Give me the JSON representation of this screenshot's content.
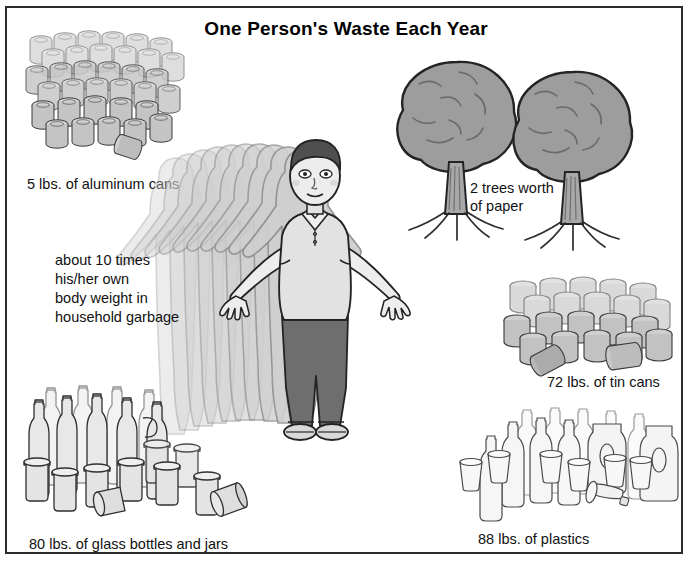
{
  "poster": {
    "title": "One Person's Waste Each Year",
    "background": "#ffffff",
    "border_color": "#2b2b2b",
    "text_color": "#111111"
  },
  "items": [
    {
      "id": "aluminum-cans",
      "label": "5 lbs. of aluminum cans",
      "amount": 5,
      "unit": "lbs.",
      "material": "aluminum cans"
    },
    {
      "id": "paper-trees",
      "label": "2 trees worth\nof paper",
      "amount": 2,
      "unit": "trees",
      "material": "paper"
    },
    {
      "id": "household-garbage",
      "label": "about 10 times\nhis/her own\nbody weight in\nhousehold garbage",
      "amount": 10,
      "unit": "times body weight",
      "material": "household garbage"
    },
    {
      "id": "tin-cans",
      "label": "72 lbs. of tin cans",
      "amount": 72,
      "unit": "lbs.",
      "material": "tin cans"
    },
    {
      "id": "glass",
      "label": "80 lbs. of glass bottles and jars",
      "amount": 80,
      "unit": "lbs.",
      "material": "glass bottles and jars"
    },
    {
      "id": "plastics",
      "label": "88 lbs. of plastics",
      "amount": 88,
      "unit": "lbs.",
      "material": "plastics"
    }
  ],
  "figure": {
    "ghost_copies": 10,
    "hair_color": "#4f4f4f",
    "shirt_color": "#e2e2e2",
    "pants_color": "#6e6e6e",
    "skin_color": "#ededed"
  },
  "palette": {
    "metal_fill": "#c9c9c9",
    "metal_stroke": "#3a3a3a",
    "tree_canopy": "#9a9a9a",
    "tree_trunk": "#a8a8a8",
    "glass_fill": "#e8e8e8",
    "plastic_fill": "#f4f4f4",
    "ghost_fill": "#cdcdcd",
    "ghost_stroke": "#8e8e8e"
  }
}
